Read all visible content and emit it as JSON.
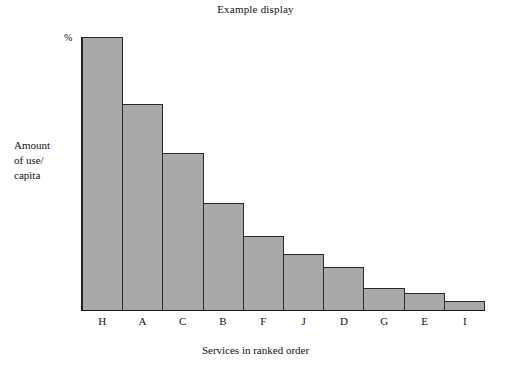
{
  "chart_data": {
    "type": "bar",
    "title": "Example display",
    "xlabel": "Services in ranked order",
    "ylabel": "Amount of use/ capita",
    "ylabel_lines": [
      "Amount",
      "of use/",
      "capita"
    ],
    "y_unit_marker": "%",
    "categories": [
      "H",
      "A",
      "C",
      "B",
      "F",
      "J",
      "D",
      "G",
      "E",
      "I"
    ],
    "values": [
      100,
      75.6,
      57.6,
      39.3,
      27.1,
      20.6,
      15.6,
      8.0,
      6.1,
      3.4
    ],
    "ylim": [
      0,
      100
    ],
    "xlim_categories": 10,
    "grid": false,
    "legend": null,
    "bar_fill_color": "#a9a9a9",
    "bar_edge_color": "#2a2a2a",
    "axis_color": "#1a1a1a",
    "background_color": "#ffffff"
  }
}
